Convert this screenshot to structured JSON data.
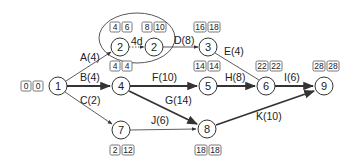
{
  "diagram": {
    "nodes": [
      {
        "id": "n1",
        "label": "1",
        "x": 58,
        "y": 86,
        "times": [
          "0",
          "0"
        ],
        "box_x": 21,
        "box_y": 80
      },
      {
        "id": "n2a",
        "label": "2",
        "x": 120,
        "y": 47,
        "times": [
          "4",
          "6"
        ],
        "box_x": 110,
        "box_y": 22
      },
      {
        "id": "n2b",
        "label": "2",
        "x": 154,
        "y": 47,
        "times": [
          "8",
          "10"
        ],
        "box_x": 143,
        "box_y": 22
      },
      {
        "id": "n3",
        "label": "3",
        "x": 208,
        "y": 47,
        "times": [
          "16",
          "18"
        ],
        "box_x": 193,
        "box_y": 22
      },
      {
        "id": "n4",
        "label": "4",
        "x": 121,
        "y": 86,
        "times": [
          "4",
          "4"
        ],
        "box_x": 110,
        "box_y": 61
      },
      {
        "id": "n5",
        "label": "5",
        "x": 208,
        "y": 86,
        "times": [
          "14",
          "14"
        ],
        "box_x": 193,
        "box_y": 61
      },
      {
        "id": "n6",
        "label": "6",
        "x": 266,
        "y": 86,
        "times": [
          "22",
          "22"
        ],
        "box_x": 255,
        "box_y": 61
      },
      {
        "id": "n7",
        "label": "7",
        "x": 121,
        "y": 130,
        "times": [
          "2",
          "12"
        ],
        "box_x": 110,
        "box_y": 146
      },
      {
        "id": "n8",
        "label": "8",
        "x": 207,
        "y": 129,
        "times": [
          "18",
          "18"
        ],
        "box_x": 195,
        "box_y": 146
      },
      {
        "id": "n9",
        "label": "9",
        "x": 324,
        "y": 86,
        "times": [
          "28",
          "28"
        ],
        "box_x": 313,
        "box_y": 61
      }
    ],
    "activities": [
      {
        "id": "A",
        "label": "A(4)",
        "from": "n1",
        "to": "n2a"
      },
      {
        "id": "B",
        "label": "B(4)",
        "from": "n1",
        "to": "n4"
      },
      {
        "id": "C",
        "label": "C(2)",
        "from": "n1",
        "to": "n7"
      },
      {
        "id": "lag",
        "label": "4d",
        "from": "n2a",
        "to": "n2b"
      },
      {
        "id": "D",
        "label": "D(8)",
        "from": "n2b",
        "to": "n3"
      },
      {
        "id": "E",
        "label": "E(4)",
        "from": "n3",
        "to": "n6"
      },
      {
        "id": "F",
        "label": "F(10)",
        "from": "n4",
        "to": "n5"
      },
      {
        "id": "G",
        "label": "G(14)",
        "from": "n4",
        "to": "n8"
      },
      {
        "id": "H",
        "label": "H(8)",
        "from": "n5",
        "to": "n6"
      },
      {
        "id": "I",
        "label": "I(6)",
        "from": "n6",
        "to": "n9"
      },
      {
        "id": "J",
        "label": "J(6)",
        "from": "n7",
        "to": "n8"
      },
      {
        "id": "K",
        "label": "K(10)",
        "from": "n8",
        "to": "n9"
      }
    ]
  }
}
